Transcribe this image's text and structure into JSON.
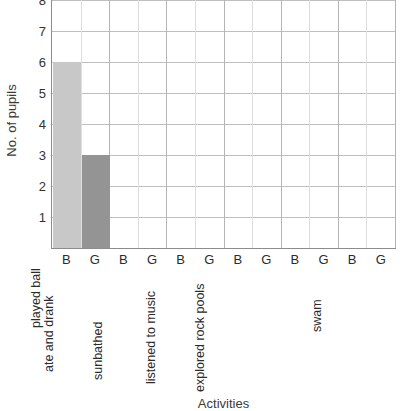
{
  "chart_data": {
    "type": "bar",
    "title": "",
    "xlabel": "Activities",
    "ylabel": "No. of pupils",
    "ylim": [
      0,
      8
    ],
    "y_ticks": [
      1,
      2,
      3,
      4,
      5,
      6,
      7,
      8
    ],
    "grid": true,
    "legend": "none",
    "group_labels": [
      "B",
      "G"
    ],
    "categories": [
      "played ball",
      "ate and drank",
      "sunbathed",
      "listened to music",
      "explored rock pools",
      "swam"
    ],
    "series": [
      {
        "name": "B",
        "color": "#c8c8c8",
        "values": [
          6,
          0,
          0,
          0,
          0,
          0
        ]
      },
      {
        "name": "G",
        "color": "#949494",
        "values": [
          3,
          0,
          0,
          0,
          0,
          0
        ]
      }
    ]
  },
  "axis": {
    "y_title": "No. of pupils",
    "x_title": "Activities"
  },
  "colors": {
    "bar_b": "#c8c8c8",
    "bar_g": "#949494",
    "grid_major": "#bfbfbf",
    "grid_minor": "#dedede",
    "axis_line": "#8c8c8c",
    "text": "#2b2b2b",
    "background": "#ffffff"
  }
}
